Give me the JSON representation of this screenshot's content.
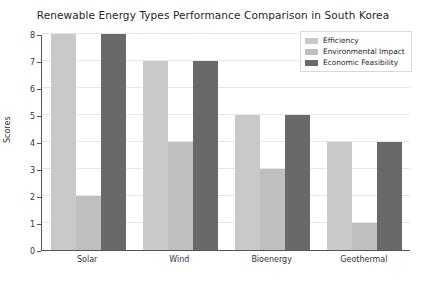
{
  "chart_data": {
    "type": "bar",
    "title": "Renewable Energy Types Performance Comparison in South Korea",
    "xlabel": "",
    "ylabel": "Scores",
    "categories": [
      "Solar",
      "Wind",
      "Bioenergy",
      "Geothermal"
    ],
    "series": [
      {
        "name": "Efficiency",
        "values": [
          8,
          7,
          5,
          4
        ],
        "color": "#c9c9c9"
      },
      {
        "name": "Environmental Impact",
        "values": [
          2,
          4,
          3,
          1
        ],
        "color": "#bfbfbf"
      },
      {
        "name": "Economic Feasibility",
        "values": [
          8,
          7,
          5,
          4
        ],
        "color": "#696969"
      }
    ],
    "ylim": [
      0,
      8
    ],
    "yticks": [
      0,
      1,
      2,
      3,
      4,
      5,
      6,
      7,
      8
    ],
    "ytick_labels": [
      "0",
      "1",
      "2",
      "3",
      "4",
      "5",
      "6",
      "7",
      "8"
    ],
    "grid": true,
    "grid_axis": "y",
    "legend_position": "upper right",
    "background": "#ffffff",
    "axis_color": "#555555",
    "grid_color": "#e6e6e6"
  }
}
